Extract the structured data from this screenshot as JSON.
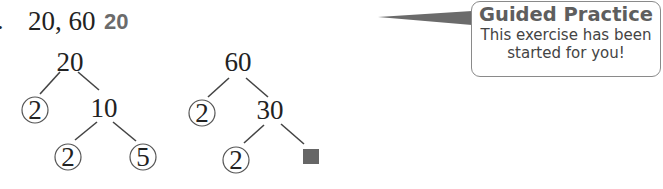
{
  "exercise": {
    "number_fragment": ".",
    "problem_text": "20, 60",
    "answer_text": "20"
  },
  "callout": {
    "title": "Guided Practice",
    "line1": "This exercise has been",
    "line2": "started for you!",
    "pointer_color": "#6b6b6b",
    "border_color": "#8a8a8a"
  },
  "factor_trees": [
    {
      "root": "20",
      "left_leaf": "2",
      "branch": "10",
      "branch_left_leaf": "2",
      "branch_right_leaf": "5"
    },
    {
      "root": "60",
      "left_leaf": "2",
      "branch": "30",
      "branch_left_leaf": "2",
      "branch_right_leaf": "missing",
      "missing_marker_color": "#666666"
    }
  ]
}
